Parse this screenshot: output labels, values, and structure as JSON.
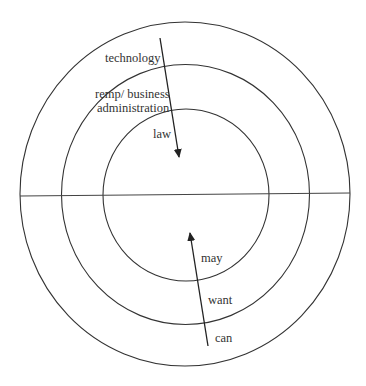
{
  "diagram": {
    "type": "concentric-circles",
    "colors": {
      "stroke": "#333333",
      "text": "#333333",
      "background": "#ffffff"
    },
    "circles": [
      {
        "name": "outer",
        "cx": 185,
        "cy": 194,
        "rx": 165,
        "ry": 172
      },
      {
        "name": "middle",
        "cx": 185.5,
        "cy": 194.5,
        "rx": 124,
        "ry": 130
      },
      {
        "name": "inner",
        "cx": 186,
        "cy": 195,
        "rx": 83,
        "ry": 86
      }
    ],
    "divider": {
      "x1": 20,
      "y1": 196,
      "x2": 350,
      "y2": 193
    },
    "top_half": {
      "arrow": {
        "x1": 160,
        "y1": 38,
        "x2": 179,
        "y2": 157,
        "direction": "inward"
      },
      "labels": [
        {
          "text": "technology",
          "x": 105,
          "y": 62
        },
        {
          "text": "remp/ business",
          "x": 95,
          "y": 98
        },
        {
          "text": "administration",
          "x": 97,
          "y": 112
        },
        {
          "text": "law",
          "x": 153,
          "y": 138
        }
      ]
    },
    "bottom_half": {
      "arrow": {
        "x1": 208,
        "y1": 346,
        "x2": 190,
        "y2": 233,
        "direction": "outward-to-inward"
      },
      "labels": [
        {
          "text": "may",
          "x": 201,
          "y": 262
        },
        {
          "text": "want",
          "x": 208,
          "y": 304
        },
        {
          "text": "can",
          "x": 215,
          "y": 342
        }
      ]
    }
  }
}
